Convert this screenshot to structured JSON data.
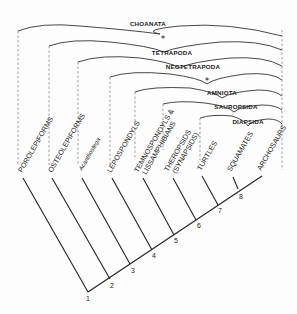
{
  "clades": [
    {
      "name": "CHOANATA",
      "marker": ""
    },
    {
      "name": "TETRAPODA",
      "marker": "*"
    },
    {
      "name": "NEOTETRAPODA",
      "marker": ""
    },
    {
      "name": "AMNIOTA",
      "marker": "*"
    },
    {
      "name": "SAUROPSIDA",
      "marker": ""
    },
    {
      "name": "DIAPSIDA",
      "marker": ""
    }
  ],
  "taxa": [
    {
      "name": "POROLEPIFORMS"
    },
    {
      "name": "OSTEOLEPIFORMS"
    },
    {
      "name": "Acanthostega"
    },
    {
      "name": "LEPOSPONDYLS"
    },
    {
      "name": "TEMNOSPONDYLS &",
      "line2": "LISSAMPHIBIANS"
    },
    {
      "name": "THEROPSIDS",
      "line2": "(SYNAPSIDS)"
    },
    {
      "name": "TURTLES"
    },
    {
      "name": "SQUAMATES"
    },
    {
      "name": "ARCHOSAURS"
    }
  ],
  "nodes": [
    "1",
    "2",
    "3",
    "4",
    "5",
    "6",
    "7",
    "8"
  ],
  "colors": {
    "ink": "#222222",
    "background": "#fdfdfd"
  }
}
